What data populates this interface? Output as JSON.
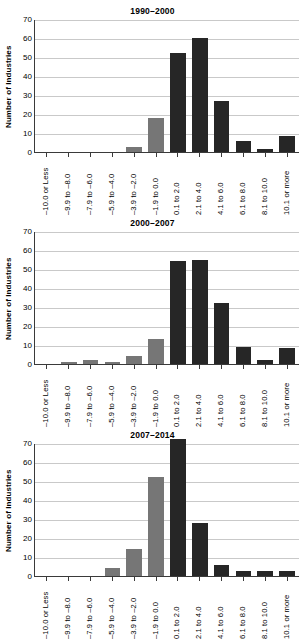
{
  "figure": {
    "ylabel": "Number of Industries",
    "yticks": [
      "70",
      "60",
      "50",
      "40",
      "30",
      "20",
      "10",
      "0"
    ],
    "categories": [
      "–10.0 or Less",
      "–9.9 to –8.0",
      "–7.9 to –6.0",
      "–5.9 to –4.0",
      "–3.9 to –2.0",
      "–1.9 to 0.0",
      "0.1 to 2.0",
      "2.1 to 4.0",
      "4.1 to 6.0",
      "6.1 to 8.0",
      "8.1 to 10.0",
      "10.1 or more"
    ],
    "colors": {
      "gray_bar": "#767676",
      "dark_bar": "#262626",
      "gridline": "#c9c9c9",
      "axis": "#3a3a3a"
    }
  },
  "chart_data": [
    {
      "type": "bar",
      "title": "1990–2000",
      "xlabel": "",
      "ylabel": "Number of Industries",
      "ylim": [
        0,
        70
      ],
      "ytick_step": 10,
      "grid": true,
      "legend": "none",
      "categories": [
        "–10.0 or Less",
        "–9.9 to –8.0",
        "–7.9 to –6.0",
        "–5.9 to –4.0",
        "–3.9 to –2.0",
        "–1.9 to 0.0",
        "0.1 to 2.0",
        "2.1 to 4.0",
        "4.1 to 6.0",
        "6.1 to 8.0",
        "8.1 to 10.0",
        "10.1 or more"
      ],
      "values": [
        0,
        0,
        0,
        0,
        2.5,
        18,
        52,
        60,
        27,
        6,
        1.5,
        8.5
      ],
      "bar_colors": [
        "gray",
        "gray",
        "gray",
        "gray",
        "gray",
        "gray",
        "dark",
        "dark",
        "dark",
        "dark",
        "dark",
        "dark"
      ]
    },
    {
      "type": "bar",
      "title": "2000–2007",
      "xlabel": "",
      "ylabel": "Number of Industries",
      "ylim": [
        0,
        70
      ],
      "ytick_step": 10,
      "grid": true,
      "legend": "none",
      "categories": [
        "–10.0 or Less",
        "–9.9 to –8.0",
        "–7.9 to –6.0",
        "–5.9 to –4.0",
        "–3.9 to –2.0",
        "–1.9 to 0.0",
        "0.1 to 2.0",
        "2.1 to 4.0",
        "4.1 to 6.0",
        "6.1 to 8.0",
        "8.1 to 10.0",
        "10.1 or more"
      ],
      "values": [
        0,
        1,
        2,
        1,
        4,
        13,
        54,
        55,
        32,
        9,
        2,
        8.5
      ],
      "bar_colors": [
        "gray",
        "gray",
        "gray",
        "gray",
        "gray",
        "gray",
        "dark",
        "dark",
        "dark",
        "dark",
        "dark",
        "dark"
      ]
    },
    {
      "type": "bar",
      "title": "2007–2014",
      "xlabel": "",
      "ylabel": "Number of Industries",
      "ylim": [
        0,
        70
      ],
      "ytick_step": 10,
      "grid": true,
      "legend": "none",
      "categories": [
        "–10.0 or Less",
        "–9.9 to –8.0",
        "–7.9 to –6.0",
        "–5.9 to –4.0",
        "–3.9 to –2.0",
        "–1.9 to 0.0",
        "0.1 to 2.0",
        "2.1 to 4.0",
        "4.1 to 6.0",
        "6.1 to 8.0",
        "8.1 to 10.0",
        "10.1 or more"
      ],
      "values": [
        0,
        0,
        0,
        4,
        14,
        52,
        72,
        28,
        6,
        2.5,
        2.5,
        2.5
      ],
      "bar_colors": [
        "gray",
        "gray",
        "gray",
        "gray",
        "gray",
        "gray",
        "dark",
        "dark",
        "dark",
        "dark",
        "dark",
        "dark"
      ]
    }
  ]
}
